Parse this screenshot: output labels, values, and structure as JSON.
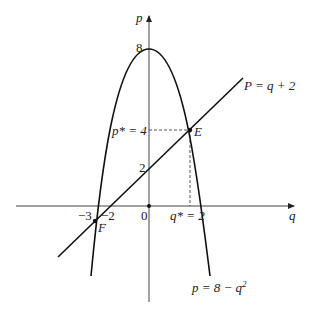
{
  "diagram": {
    "axes": {
      "x_label": "q",
      "y_label": "p",
      "origin_label": "0"
    },
    "ticks": {
      "y_8": "8",
      "y_2": "2",
      "x_neg3": "−3",
      "x_neg2": "−2"
    },
    "equilibrium": {
      "p_star_label": "p* = 4",
      "q_star_label": "q* = 2",
      "point_E": "E",
      "point_F": "F"
    },
    "curves": {
      "line_label": "P = q + 2",
      "parabola_label": "p = 8 − q²",
      "parabola_label_base": "p = 8 − q",
      "parabola_label_sup": "2"
    },
    "colors": {
      "ink": "#222222",
      "background": "#ffffff"
    }
  }
}
